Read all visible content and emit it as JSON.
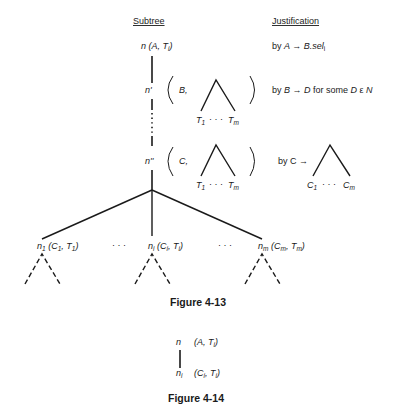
{
  "figure_4_13": {
    "headers": {
      "subtree": "Subtree",
      "justification": "Justification"
    },
    "root": {
      "node": "n",
      "label": "(A, T",
      "label_sub": "i",
      "label_close": ")"
    },
    "root_just": {
      "prefix": "by ",
      "rule": "A → B.sel",
      "rule_sub": "i"
    },
    "n_prime": {
      "node": "n'",
      "sym": "B,",
      "leaf_left": "T",
      "leaf_left_sub": "1",
      "dots": "· · ·",
      "leaf_right": "T",
      "leaf_right_sub": "m"
    },
    "n_prime_just": {
      "text": "by B → D for some D ε N"
    },
    "n_dprime": {
      "node": "n''",
      "sym": "C,",
      "leaf_left": "T",
      "leaf_left_sub": "1",
      "dots": "· · ·",
      "leaf_right": "T",
      "leaf_right_sub": "m"
    },
    "n_dprime_just": {
      "prefix": "by C →",
      "leaf_left": "C",
      "leaf_left_sub": "1",
      "dots": "· · ·",
      "leaf_right": "C",
      "leaf_right_sub": "m"
    },
    "children": [
      {
        "node": "n",
        "node_sub": "1",
        "label": "(C",
        "label_sub1": "1",
        "mid": ", T",
        "label_sub2": "1",
        "close": ")"
      },
      {
        "node": "n",
        "node_sub": "i",
        "label": "(C",
        "label_sub1": "i",
        "mid": ", T",
        "label_sub2": "i",
        "close": ")"
      },
      {
        "node": "n",
        "node_sub": "m",
        "label": "(C",
        "label_sub1": "m",
        "mid": ", T",
        "label_sub2": "m",
        "close": ")"
      }
    ],
    "ellipsis": "· · ·",
    "caption": "Figure 4-13"
  },
  "figure_4_14": {
    "top": {
      "node": "n",
      "label": "(A, T",
      "label_sub": "i",
      "close": ")"
    },
    "bottom": {
      "node": "n",
      "node_sub": "i",
      "label": "(C",
      "label_sub1": "i",
      "mid": ", T",
      "label_sub2": "i",
      "close": ")"
    },
    "caption": "Figure 4-14"
  }
}
